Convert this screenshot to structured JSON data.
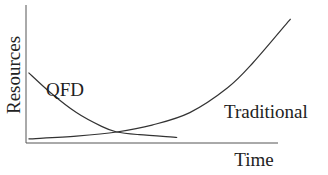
{
  "chart_data": {
    "type": "line",
    "title": "",
    "xlabel": "Time",
    "ylabel": "Resources",
    "grid": false,
    "xlim": [
      0,
      1
    ],
    "ylim": [
      0,
      1
    ],
    "series": [
      {
        "name": "QFD",
        "label": "QFD",
        "shape": "decaying",
        "x": [
          0.01,
          0.1,
          0.2,
          0.3,
          0.36,
          0.45,
          0.6
        ],
        "y": [
          0.51,
          0.36,
          0.22,
          0.12,
          0.08,
          0.06,
          0.04
        ]
      },
      {
        "name": "Traditional",
        "label": "Traditional",
        "shape": "growing",
        "x": [
          0.01,
          0.2,
          0.36,
          0.5,
          0.65,
          0.8,
          0.9,
          1.05
        ],
        "y": [
          0.03,
          0.05,
          0.08,
          0.13,
          0.22,
          0.4,
          0.58,
          0.9
        ]
      }
    ]
  },
  "colors": {
    "line": "#333333",
    "axis": "#444444",
    "text": "#222222"
  }
}
